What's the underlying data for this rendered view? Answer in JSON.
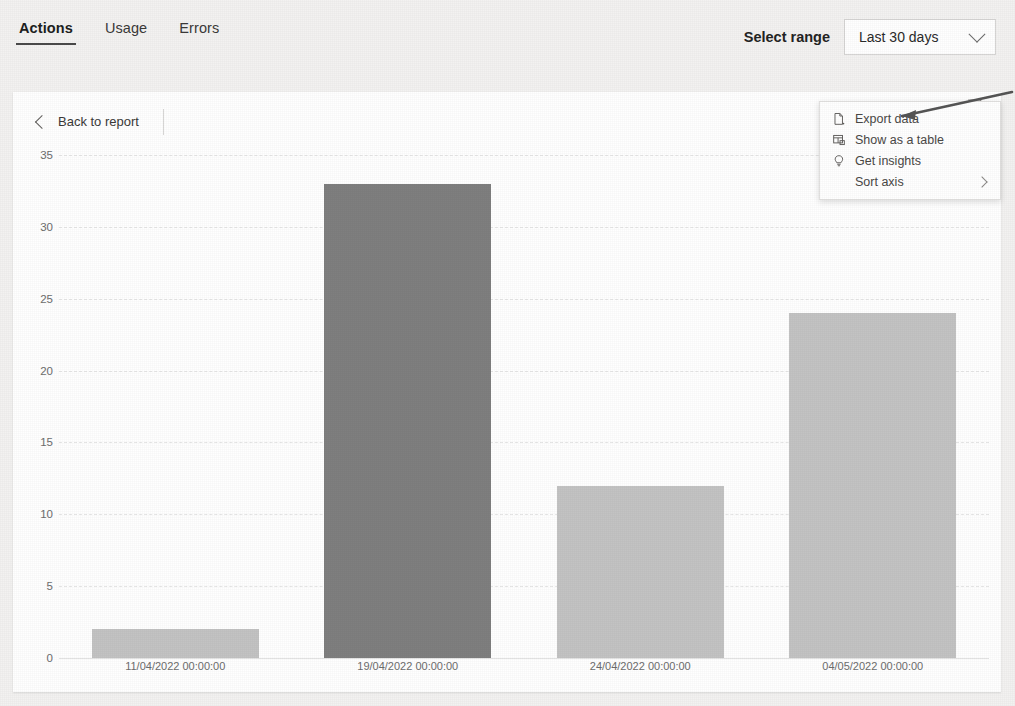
{
  "header": {
    "tabs": [
      {
        "label": "Actions",
        "selected": true
      },
      {
        "label": "Usage",
        "selected": false
      },
      {
        "label": "Errors",
        "selected": false
      }
    ],
    "range_label": "Select range",
    "range_value": "Last 30 days",
    "range_chevron_icon": "chevron-down-icon"
  },
  "card": {
    "back_label": "Back to report",
    "back_icon": "chevron-left-icon",
    "filter_icon": "filter-funnel-icon"
  },
  "context_menu": {
    "items": [
      {
        "label": "Export data",
        "icon": "export-file-icon",
        "submenu": false
      },
      {
        "label": "Show as a table",
        "icon": "table-icon",
        "submenu": false
      },
      {
        "label": "Get insights",
        "icon": "lightbulb-icon",
        "submenu": false
      },
      {
        "label": "Sort axis",
        "icon": "",
        "submenu": true
      }
    ],
    "submenu_icon": "chevron-right-icon"
  },
  "annotation": {
    "shape": "arrow",
    "points_to": "Export data"
  },
  "chart_data": {
    "type": "bar",
    "title": "",
    "xlabel": "",
    "ylabel": "",
    "categories": [
      "11/04/2022 00:00:00",
      "19/04/2022 00:00:00",
      "24/04/2022 00:00:00",
      "04/05/2022 00:00:00"
    ],
    "values": [
      2,
      33,
      12,
      24
    ],
    "highlighted_index": 1,
    "bar_color": "#c3c3c3",
    "bar_color_highlight": "#7f7f7f",
    "ylim": [
      0,
      35
    ],
    "yticks": [
      0,
      5,
      10,
      15,
      20,
      25,
      30,
      35
    ],
    "ytick_labels": [
      "0",
      "5",
      "10",
      "15",
      "20",
      "25",
      "30",
      "35"
    ],
    "grid": true,
    "legend": false
  }
}
